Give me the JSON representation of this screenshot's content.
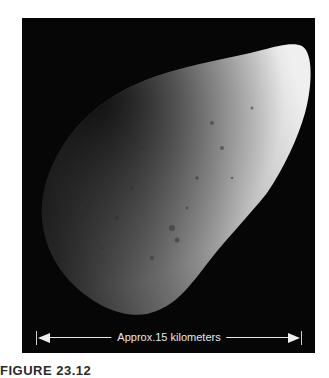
{
  "figure": {
    "image_subject": "asteroid",
    "scale_bar": {
      "label": "Approx.15 kilometers"
    },
    "caption": "FIGURE 23.12"
  },
  "colors": {
    "background": "#ffffff",
    "photo_background": "#060606",
    "scale_bar": "#eeeeee"
  }
}
